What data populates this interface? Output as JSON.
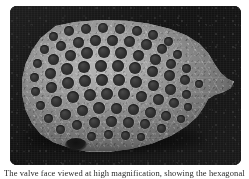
{
  "figure": {
    "name": "sem-micrograph-plate",
    "alt_label": "Scanning electron micrograph of a perforated microfossil test",
    "background_color": "#161616",
    "plate_corner_radius_px": 7
  },
  "specimen": {
    "label": "microfossil-test",
    "description": "Ovoid siliceous test with a pointed apex at right, blunt margin at left, and a hexagonally packed field of circular pores across the valve face",
    "wall_color": "#9e9e9e",
    "pore_color": "#2e2e2e",
    "rim_highlight_color": "#ebebeb",
    "notch_label": "ventral notch",
    "pore_count": 78,
    "pores": [
      {
        "x": 34,
        "y": 18,
        "d": 9
      },
      {
        "x": 50,
        "y": 13,
        "d": 10
      },
      {
        "x": 67,
        "y": 11,
        "d": 10
      },
      {
        "x": 84,
        "y": 10,
        "d": 10
      },
      {
        "x": 101,
        "y": 11,
        "d": 10
      },
      {
        "x": 118,
        "y": 13,
        "d": 10
      },
      {
        "x": 134,
        "y": 17,
        "d": 10
      },
      {
        "x": 149,
        "y": 23,
        "d": 9
      },
      {
        "x": 25,
        "y": 31,
        "d": 9
      },
      {
        "x": 42,
        "y": 28,
        "d": 10
      },
      {
        "x": 59,
        "y": 24,
        "d": 11
      },
      {
        "x": 76,
        "y": 22,
        "d": 11
      },
      {
        "x": 93,
        "y": 22,
        "d": 11
      },
      {
        "x": 110,
        "y": 23,
        "d": 11
      },
      {
        "x": 127,
        "y": 26,
        "d": 11
      },
      {
        "x": 143,
        "y": 31,
        "d": 10
      },
      {
        "x": 158,
        "y": 36,
        "d": 9
      },
      {
        "x": 18,
        "y": 45,
        "d": 9
      },
      {
        "x": 34,
        "y": 41,
        "d": 11
      },
      {
        "x": 51,
        "y": 37,
        "d": 11
      },
      {
        "x": 68,
        "y": 35,
        "d": 12
      },
      {
        "x": 85,
        "y": 34,
        "d": 12
      },
      {
        "x": 102,
        "y": 35,
        "d": 12
      },
      {
        "x": 119,
        "y": 37,
        "d": 11
      },
      {
        "x": 136,
        "y": 41,
        "d": 11
      },
      {
        "x": 152,
        "y": 46,
        "d": 10
      },
      {
        "x": 167,
        "y": 50,
        "d": 9
      },
      {
        "x": 15,
        "y": 59,
        "d": 9
      },
      {
        "x": 31,
        "y": 55,
        "d": 11
      },
      {
        "x": 48,
        "y": 51,
        "d": 12
      },
      {
        "x": 65,
        "y": 49,
        "d": 12
      },
      {
        "x": 82,
        "y": 48,
        "d": 12
      },
      {
        "x": 99,
        "y": 48,
        "d": 12
      },
      {
        "x": 116,
        "y": 50,
        "d": 12
      },
      {
        "x": 133,
        "y": 53,
        "d": 11
      },
      {
        "x": 150,
        "y": 57,
        "d": 11
      },
      {
        "x": 166,
        "y": 62,
        "d": 10
      },
      {
        "x": 180,
        "y": 66,
        "d": 8
      },
      {
        "x": 16,
        "y": 73,
        "d": 9
      },
      {
        "x": 32,
        "y": 69,
        "d": 11
      },
      {
        "x": 49,
        "y": 65,
        "d": 12
      },
      {
        "x": 66,
        "y": 63,
        "d": 12
      },
      {
        "x": 83,
        "y": 62,
        "d": 12
      },
      {
        "x": 100,
        "y": 62,
        "d": 12
      },
      {
        "x": 117,
        "y": 64,
        "d": 12
      },
      {
        "x": 134,
        "y": 67,
        "d": 11
      },
      {
        "x": 151,
        "y": 71,
        "d": 11
      },
      {
        "x": 167,
        "y": 76,
        "d": 9
      },
      {
        "x": 21,
        "y": 87,
        "d": 9
      },
      {
        "x": 37,
        "y": 83,
        "d": 11
      },
      {
        "x": 54,
        "y": 79,
        "d": 12
      },
      {
        "x": 71,
        "y": 77,
        "d": 12
      },
      {
        "x": 88,
        "y": 76,
        "d": 12
      },
      {
        "x": 105,
        "y": 76,
        "d": 12
      },
      {
        "x": 122,
        "y": 78,
        "d": 11
      },
      {
        "x": 139,
        "y": 81,
        "d": 11
      },
      {
        "x": 155,
        "y": 85,
        "d": 10
      },
      {
        "x": 169,
        "y": 89,
        "d": 8
      },
      {
        "x": 29,
        "y": 100,
        "d": 9
      },
      {
        "x": 46,
        "y": 96,
        "d": 11
      },
      {
        "x": 63,
        "y": 92,
        "d": 11
      },
      {
        "x": 80,
        "y": 90,
        "d": 12
      },
      {
        "x": 97,
        "y": 90,
        "d": 11
      },
      {
        "x": 114,
        "y": 91,
        "d": 11
      },
      {
        "x": 131,
        "y": 94,
        "d": 11
      },
      {
        "x": 147,
        "y": 98,
        "d": 10
      },
      {
        "x": 162,
        "y": 101,
        "d": 8
      },
      {
        "x": 41,
        "y": 111,
        "d": 9
      },
      {
        "x": 58,
        "y": 107,
        "d": 10
      },
      {
        "x": 75,
        "y": 104,
        "d": 11
      },
      {
        "x": 92,
        "y": 103,
        "d": 11
      },
      {
        "x": 109,
        "y": 104,
        "d": 11
      },
      {
        "x": 126,
        "y": 106,
        "d": 10
      },
      {
        "x": 142,
        "y": 110,
        "d": 9
      },
      {
        "x": 72,
        "y": 118,
        "d": 9
      },
      {
        "x": 89,
        "y": 116,
        "d": 9
      },
      {
        "x": 106,
        "y": 117,
        "d": 9
      },
      {
        "x": 122,
        "y": 119,
        "d": 8
      }
    ]
  },
  "caption": {
    "text": "The valve face viewed at high magnification, showing the hexagonally arranged areolae.",
    "cropped": true
  }
}
